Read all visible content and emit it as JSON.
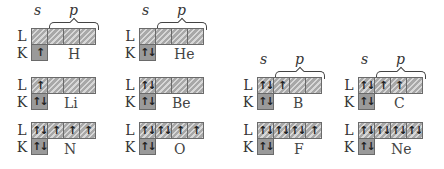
{
  "figure": {
    "subshell_labels": {
      "s": "s",
      "p": "p"
    },
    "shell_labels": {
      "L": "L",
      "K": "K"
    },
    "colors": {
      "cell_fill": "#a8a8a8",
      "cell_border": "#6a6a6a",
      "text": "#333333"
    }
  },
  "atoms": [
    {
      "symbol": "H",
      "K": [
        "↑"
      ],
      "L": [
        "",
        "",
        "",
        ""
      ]
    },
    {
      "symbol": "He",
      "K": [
        "↑↓"
      ],
      "L": [
        "",
        "",
        "",
        ""
      ]
    },
    {
      "symbol": "Li",
      "K": [
        "↑↓"
      ],
      "L": [
        "↑",
        "",
        "",
        ""
      ]
    },
    {
      "symbol": "Be",
      "K": [
        "↑↓"
      ],
      "L": [
        "↑↓",
        "",
        "",
        ""
      ]
    },
    {
      "symbol": "B",
      "K": [
        "↑↓"
      ],
      "L": [
        "↑↓",
        "↑",
        "",
        ""
      ]
    },
    {
      "symbol": "C",
      "K": [
        "↑↓"
      ],
      "L": [
        "↑↓",
        "↑",
        "↑",
        ""
      ]
    },
    {
      "symbol": "N",
      "K": [
        "↑↓"
      ],
      "L": [
        "↑↓",
        "↑",
        "↑",
        "↑"
      ]
    },
    {
      "symbol": "O",
      "K": [
        "↑↓"
      ],
      "L": [
        "↑↓",
        "↑↓",
        "↑",
        "↑"
      ]
    },
    {
      "symbol": "F",
      "K": [
        "↑↓"
      ],
      "L": [
        "↑↓",
        "↑↓",
        "↑↓",
        "↑"
      ]
    },
    {
      "symbol": "Ne",
      "K": [
        "↑↓"
      ],
      "L": [
        "↑↓",
        "↑↓",
        "↑↓",
        "↑↓"
      ]
    }
  ]
}
